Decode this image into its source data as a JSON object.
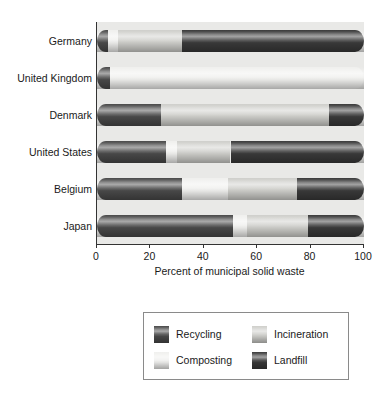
{
  "chart_data": {
    "type": "bar",
    "orientation": "horizontal",
    "stacked": true,
    "title": "",
    "xlabel": "Percent of municipal solid waste",
    "ylabel": "",
    "xlim": [
      0,
      100
    ],
    "xticks": [
      0,
      20,
      40,
      60,
      80,
      100
    ],
    "xtick_labels": [
      "0",
      "20",
      "40",
      "60",
      "80",
      "100"
    ],
    "grid": false,
    "legend_position": "below",
    "categories": [
      "Germany",
      "United Kingdom",
      "Denmark",
      "United States",
      "Belgium",
      "Japan"
    ],
    "series": [
      {
        "name": "Recycling",
        "color": "#4a4a4a",
        "values": [
          4,
          5,
          24,
          26,
          32,
          51
        ]
      },
      {
        "name": "Composting",
        "color": "#f0f0ee",
        "values": [
          4,
          95,
          0,
          4,
          17,
          5
        ]
      },
      {
        "name": "Incineration",
        "color": "#cfcfcb",
        "values": [
          24,
          0,
          63,
          20,
          26,
          23
        ]
      },
      {
        "name": "Landfill",
        "color": "#3a3a3a",
        "values": [
          68,
          0,
          13,
          50,
          25,
          21
        ]
      }
    ]
  },
  "axis": {
    "x_title": "Percent of municipal solid waste",
    "tick_labels": [
      "0",
      "20",
      "40",
      "60",
      "80",
      "100"
    ],
    "category_labels": [
      "Germany",
      "United Kingdom",
      "Denmark",
      "United States",
      "Belgium",
      "Japan"
    ]
  },
  "legend": {
    "entries": [
      {
        "label": "Recycling",
        "swatch": "recycling-swatch",
        "color": "#4a4a4a"
      },
      {
        "label": "Incineration",
        "swatch": "incineration-swatch",
        "color": "#cfcfcb"
      },
      {
        "label": "Composting",
        "swatch": "composting-swatch",
        "color": "#f0f0ee"
      },
      {
        "label": "Landfill",
        "swatch": "landfill-swatch",
        "color": "#3a3a3a"
      }
    ]
  }
}
